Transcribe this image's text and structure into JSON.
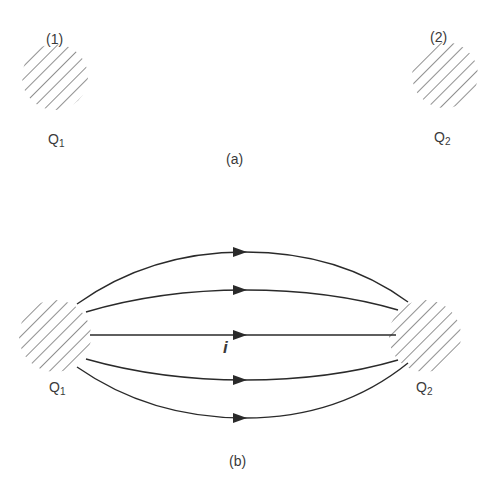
{
  "panel_a": {
    "caption": "(a)",
    "charge1": {
      "index_label": "(1)",
      "name": "Q",
      "subscript": "1"
    },
    "charge2": {
      "index_label": "(2)",
      "name": "Q",
      "subscript": "2"
    }
  },
  "panel_b": {
    "caption": "(b)",
    "current_label": "i",
    "charge1": {
      "name": "Q",
      "subscript": "1"
    },
    "charge2": {
      "name": "Q",
      "subscript": "2"
    },
    "flow_lines_count": 5,
    "arrow_direction": "from Q1 to Q2"
  },
  "colors": {
    "stroke": "#2a2a2a",
    "hatch": "#555555",
    "background": "#ffffff"
  }
}
